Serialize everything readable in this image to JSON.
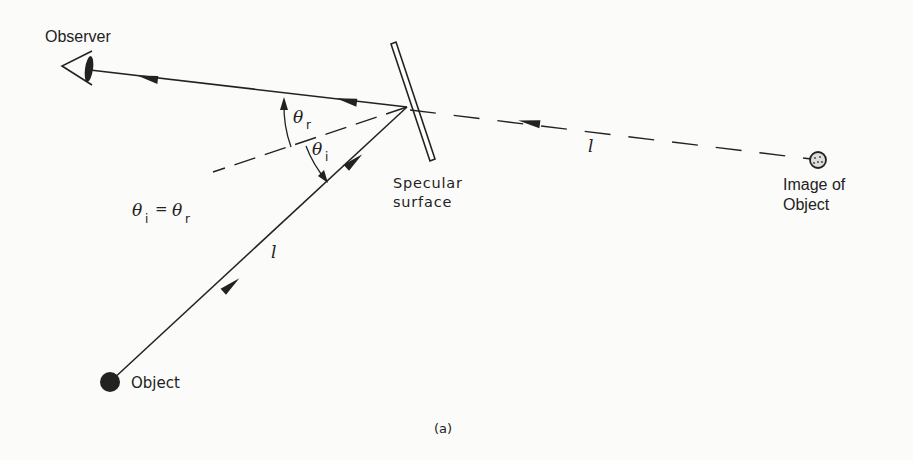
{
  "diagram": {
    "type": "specular-reflection",
    "caption": "(a)",
    "labels": {
      "observer": "Observer",
      "mirror_line1": "Specular",
      "mirror_line2": "surface",
      "image_line1": "Image of",
      "image_line2": "Object",
      "object": "Object",
      "theta": "θ",
      "sub_r": "r",
      "sub_i": "i",
      "equation_theta1": "θ",
      "equation_sub1": "i",
      "equation_eq": "=",
      "equation_theta2": "θ",
      "equation_sub2": "r",
      "path_length_incident": "l",
      "path_length_virtual": "l"
    },
    "colors": {
      "ink": "#222222",
      "background": "#fbfbfa"
    }
  }
}
